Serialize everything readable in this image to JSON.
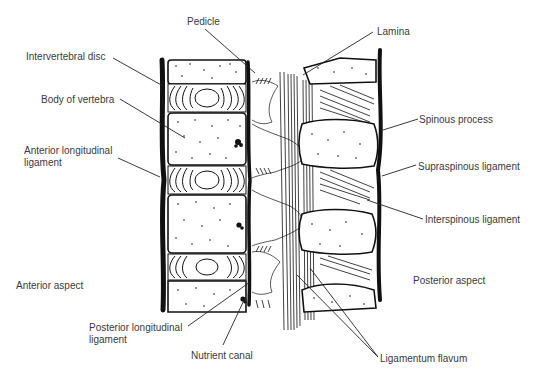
{
  "figure": {
    "width": 538,
    "height": 378,
    "colors": {
      "ink": "#111111",
      "label": "#3a3a3a",
      "background": "#ffffff"
    }
  },
  "aspects": {
    "anterior": {
      "text": "Anterior aspect",
      "x": 16,
      "y": 289
    },
    "posterior": {
      "text": "Posterior aspect",
      "x": 413,
      "y": 284
    }
  },
  "labels": [
    {
      "id": "pedicle",
      "text": "Pedicle",
      "x": 187,
      "y": 25,
      "line": [
        205,
        29,
        255,
        73
      ]
    },
    {
      "id": "lamina",
      "text": "Lamina",
      "x": 377,
      "y": 35,
      "line": [
        373,
        32,
        303,
        75
      ]
    },
    {
      "id": "intervertebral-disc",
      "text": "Intervertebral disc",
      "x": 26,
      "y": 60,
      "line": [
        113,
        58,
        163,
        86
      ]
    },
    {
      "id": "body-of-vertebra",
      "text": "Body of vertebra",
      "x": 41,
      "y": 103,
      "line": [
        120,
        99,
        185,
        138
      ]
    },
    {
      "id": "anterior-longitudinal-ligament",
      "text": [
        "Anterior longitudinal",
        "ligament"
      ],
      "x": 24,
      "y": 154,
      "line": [
        118,
        158,
        160,
        177
      ]
    },
    {
      "id": "spinous-process",
      "text": "Spinous process",
      "x": 419,
      "y": 123,
      "line": [
        418,
        119,
        383,
        130
      ]
    },
    {
      "id": "supraspinous-ligament",
      "text": "Supraspinous ligament",
      "x": 418,
      "y": 170,
      "line": [
        416,
        165,
        382,
        176
      ]
    },
    {
      "id": "interspinous-ligament",
      "text": "Interspinous ligament",
      "x": 425,
      "y": 223,
      "line": [
        423,
        219,
        367,
        200
      ]
    },
    {
      "id": "posterior-longitudinal-ligament",
      "text": [
        "Posterior longitudinal",
        "ligament"
      ],
      "x": 89,
      "y": 331,
      "line": [
        188,
        326,
        250,
        282
      ]
    },
    {
      "id": "nutrient-canal",
      "text": "Nutrient canal",
      "x": 191,
      "y": 359,
      "line": [
        223,
        345,
        245,
        298
      ]
    },
    {
      "id": "ligamentum-flavum",
      "text": "Ligamentum flavum",
      "x": 380,
      "y": 362,
      "lines": [
        [
          378,
          357,
          310,
          268
        ],
        [
          378,
          357,
          297,
          275
        ]
      ]
    }
  ]
}
